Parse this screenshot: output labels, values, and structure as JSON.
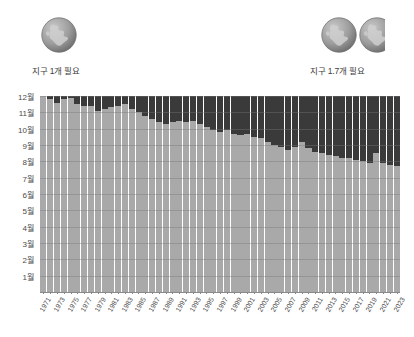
{
  "header": {
    "left_globe": {
      "icon": "globe-icon",
      "count": 1,
      "caption": "지구 1개 필요"
    },
    "right_globe": {
      "icon": "globe-icon",
      "count": 1.7,
      "caption": "지구 1.7개 필요"
    }
  },
  "colors": {
    "overshoot": "#3a3a3a",
    "within_budget": "#a9a9a9",
    "axis": "#8a8a8a",
    "text": "#3d3d3d",
    "background": "#ffffff"
  },
  "chart_data": {
    "type": "bar",
    "title": "",
    "subtitle": "",
    "xlabel": "",
    "ylabel": "",
    "stacked": true,
    "grid": true,
    "legend_position": "none",
    "ylim": [
      0,
      12
    ],
    "ytick_labels": [
      "1월",
      "2월",
      "3월",
      "4월",
      "5월",
      "6월",
      "7월",
      "8월",
      "9월",
      "10월",
      "11월",
      "12월"
    ],
    "ytick_values": [
      1,
      2,
      3,
      4,
      5,
      6,
      7,
      8,
      9,
      10,
      11,
      12
    ],
    "xtick_labels": [
      "1971",
      "1973",
      "1975",
      "1977",
      "1979",
      "1981",
      "1983",
      "1985",
      "1987",
      "1989",
      "1991",
      "1993",
      "1995",
      "1997",
      "1999",
      "2001",
      "2003",
      "2005",
      "2007",
      "2009",
      "2011",
      "2013",
      "2015",
      "2017",
      "2019",
      "2021",
      "2023"
    ],
    "categories": [
      "1971",
      "1972",
      "1973",
      "1974",
      "1975",
      "1976",
      "1977",
      "1978",
      "1979",
      "1980",
      "1981",
      "1982",
      "1983",
      "1984",
      "1985",
      "1986",
      "1987",
      "1988",
      "1989",
      "1990",
      "1991",
      "1992",
      "1993",
      "1994",
      "1995",
      "1996",
      "1997",
      "1998",
      "1999",
      "2000",
      "2001",
      "2002",
      "2003",
      "2004",
      "2005",
      "2006",
      "2007",
      "2008",
      "2009",
      "2010",
      "2011",
      "2012",
      "2013",
      "2014",
      "2015",
      "2016",
      "2017",
      "2018",
      "2019",
      "2020",
      "2021",
      "2022",
      "2023"
    ],
    "series": [
      {
        "name": "생태용량 범위 내 기간",
        "color": "#a9a9a9",
        "values": [
          12.0,
          11.8,
          11.6,
          11.8,
          11.9,
          11.5,
          11.4,
          11.4,
          11.1,
          11.2,
          11.3,
          11.4,
          11.5,
          11.2,
          11.0,
          10.8,
          10.6,
          10.4,
          10.3,
          10.4,
          10.5,
          10.4,
          10.5,
          10.3,
          10.1,
          9.9,
          9.8,
          9.9,
          9.7,
          9.6,
          9.7,
          9.5,
          9.4,
          9.2,
          9.0,
          8.9,
          8.7,
          8.9,
          9.2,
          8.8,
          8.6,
          8.5,
          8.4,
          8.3,
          8.2,
          8.2,
          8.1,
          8.0,
          7.9,
          8.5,
          7.9,
          7.8,
          7.7
        ]
      },
      {
        "name": "생태용량 초과 기간",
        "color": "#3a3a3a",
        "values": [
          0.0,
          0.2,
          0.4,
          0.2,
          0.1,
          0.5,
          0.6,
          0.6,
          0.9,
          0.8,
          0.7,
          0.6,
          0.5,
          0.8,
          1.0,
          1.2,
          1.4,
          1.6,
          1.7,
          1.6,
          1.5,
          1.6,
          1.5,
          1.7,
          1.9,
          2.1,
          2.2,
          2.1,
          2.3,
          2.4,
          2.3,
          2.5,
          2.6,
          2.8,
          3.0,
          3.1,
          3.3,
          3.1,
          2.8,
          3.2,
          3.4,
          3.5,
          3.6,
          3.7,
          3.8,
          3.8,
          3.9,
          4.0,
          4.1,
          3.5,
          4.1,
          4.2,
          4.3
        ]
      }
    ],
    "annotations": [
      {
        "name": "earths-needed-start",
        "text": "지구 1개 필요",
        "value": 1.0
      },
      {
        "name": "earths-needed-end",
        "text": "지구 1.7개 필요",
        "value": 1.7
      }
    ]
  }
}
